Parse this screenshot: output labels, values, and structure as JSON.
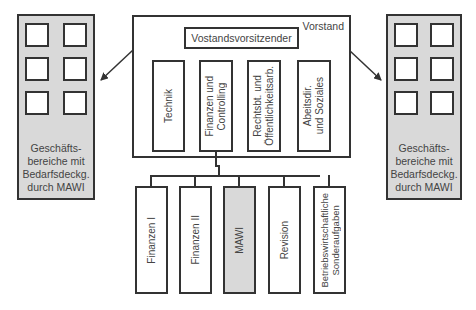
{
  "diagram": {
    "type": "org-chart",
    "left_panel": {
      "label": "Geschäfts-\nbereiche mit\nBedarfsdeckg.\ndurch MAWI",
      "fill": "#d9d9d9"
    },
    "right_panel": {
      "label": "Geschäfts-\nbereiche mit\nBedarfsdeckg.\ndurch MAWI",
      "fill": "#d9d9d9"
    },
    "board": {
      "label": "Vorstand",
      "chair": "Vostandsvorsitzender",
      "members": [
        {
          "label": "Technik"
        },
        {
          "label": "Finanzen und\nControlling"
        },
        {
          "label": "Rechtsbt. und\nÖffentlichkeitsarb."
        },
        {
          "label": "Abeitsdir.\nund Soziales"
        }
      ]
    },
    "departments": [
      {
        "label": "Finanzen I",
        "highlighted": false
      },
      {
        "label": "Finanzen II",
        "highlighted": false
      },
      {
        "label": "MAWI",
        "highlighted": true
      },
      {
        "label": "Revision",
        "highlighted": false
      },
      {
        "label": "Betriebswirtschaftliche\nSonderaufgaben",
        "highlighted": false
      }
    ],
    "colors": {
      "line": "#333333",
      "highlight": "#d9d9d9",
      "background": "#ffffff"
    }
  }
}
